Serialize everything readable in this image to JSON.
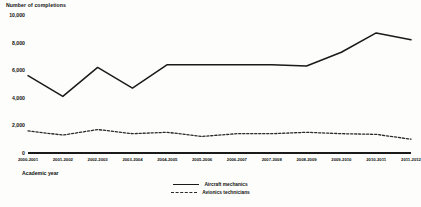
{
  "chart_data": {
    "type": "line",
    "title": "Number of completions",
    "xlabel": "Academic year",
    "ylabel": "Number of completions",
    "ylim": [
      0,
      10000
    ],
    "yticks": [
      0,
      2000,
      4000,
      6000,
      8000,
      10000
    ],
    "ytick_labels": [
      "0",
      "2,000",
      "4,000",
      "6,000",
      "8,000",
      "10,000"
    ],
    "grid": false,
    "legend_position": "bottom",
    "categories": [
      "2000-2001",
      "2001-2002",
      "2002-2003",
      "2003-2004",
      "2004-2005",
      "2005-2006",
      "2006-2007",
      "2007-2008",
      "2008-2009",
      "2009-2010",
      "2010-2011",
      "2011-2012"
    ],
    "series": [
      {
        "name": "Aircraft mechanics",
        "style": "solid",
        "color": "#1a1a1a",
        "values": [
          5600,
          4100,
          6200,
          4700,
          6400,
          6400,
          6400,
          6400,
          6300,
          7300,
          8700,
          8200
        ]
      },
      {
        "name": "Avionics technicians",
        "style": "dashed",
        "color": "#2a2a2a",
        "values": [
          1600,
          1300,
          1700,
          1400,
          1500,
          1200,
          1400,
          1400,
          1500,
          1400,
          1350,
          1000
        ]
      }
    ]
  }
}
